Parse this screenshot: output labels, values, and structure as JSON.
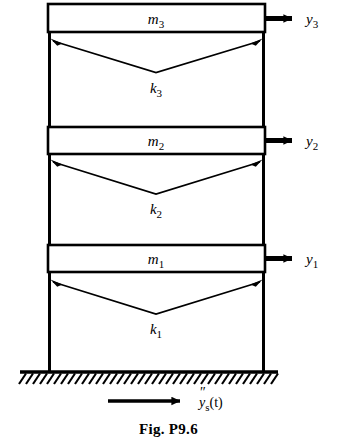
{
  "figure": {
    "caption": "Fig. P9.6",
    "colors": {
      "ink": "#000000",
      "background": "#ffffff"
    }
  },
  "stories": [
    {
      "mass_label": "m",
      "mass_subscript": "3",
      "stiffness_label": "k",
      "stiffness_subscript": "3",
      "displacement_label": "y",
      "displacement_subscript": "3"
    },
    {
      "mass_label": "m",
      "mass_subscript": "2",
      "stiffness_label": "k",
      "stiffness_subscript": "2",
      "displacement_label": "y",
      "displacement_subscript": "2"
    },
    {
      "mass_label": "m",
      "mass_subscript": "1",
      "stiffness_label": "k",
      "stiffness_subscript": "1",
      "displacement_label": "y",
      "displacement_subscript": "1"
    }
  ],
  "ground": {
    "support_type": "fixed-hatched-base",
    "excitation_label": "y",
    "excitation_subscript": "s",
    "excitation_primes": "″",
    "excitation_argument": "(t)"
  },
  "icons": {
    "displacement_arrow": "right-arrow-icon",
    "spring_arrow": "double-headed-chevron-arrow-icon",
    "ground_hatch": "hatched-ground-icon"
  }
}
